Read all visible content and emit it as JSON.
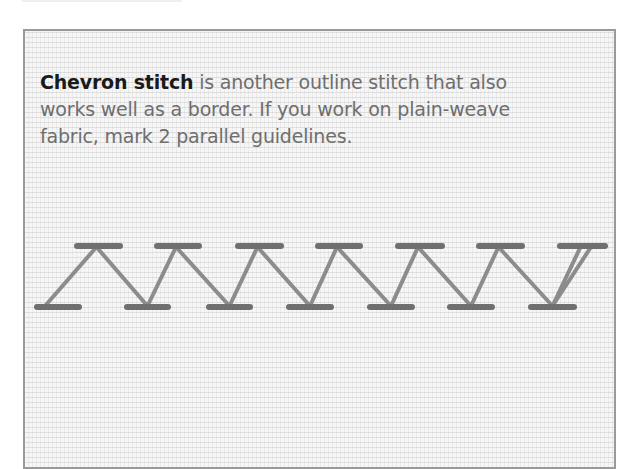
{
  "caption": {
    "term": "Chevron stitch",
    "body": " is another outline stitch that also works well as a border. If you work on plain-weave fabric, mark 2 parallel guidelines."
  },
  "illustration": {
    "subject": "chevron-stitch-sample",
    "fabric_color": "#f6f6f6",
    "frame_color": "#9a9a9a",
    "thread_color": "#8c8c8c",
    "thread_dark": "#6f6f6f",
    "top_row_y": 246,
    "bottom_row_y": 307,
    "top_bars": [
      [
        77,
        120
      ],
      [
        157,
        199
      ],
      [
        238,
        281
      ],
      [
        318,
        360
      ],
      [
        398,
        442
      ],
      [
        479,
        522
      ],
      [
        560,
        605
      ]
    ],
    "bottom_bars": [
      [
        37,
        79
      ],
      [
        127,
        168
      ],
      [
        209,
        250
      ],
      [
        289,
        331
      ],
      [
        370,
        412
      ],
      [
        450,
        492
      ],
      [
        531,
        574
      ]
    ]
  }
}
